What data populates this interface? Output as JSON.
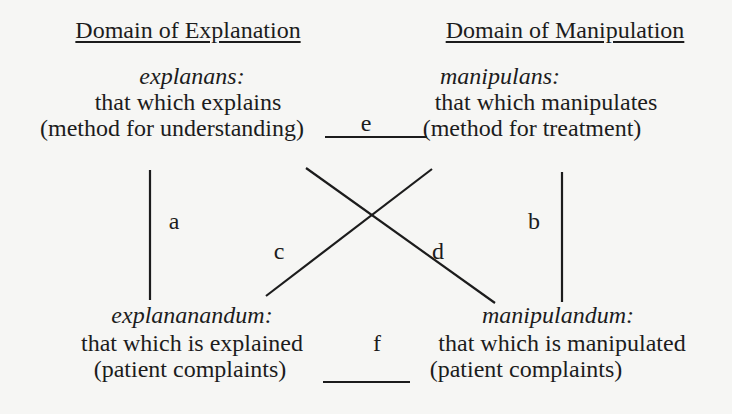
{
  "headers": {
    "left": "Domain of Explanation",
    "right": "Domain of Manipulation"
  },
  "nodes": {
    "top_left": {
      "term": "explanans:",
      "description": "that which explains",
      "detail": "(method for understanding)"
    },
    "top_right": {
      "term": "manipulans:",
      "description": "that which manipulates",
      "detail": "(method for treatment)"
    },
    "bottom_left": {
      "term": "explananandum:",
      "description": "that which is explained",
      "detail": "(patient complaints)"
    },
    "bottom_right": {
      "term": "manipulandum:",
      "description": "that which is manipulated",
      "detail": "(patient complaints)"
    }
  },
  "edges": {
    "a": "a",
    "b": "b",
    "c": "c",
    "d": "d",
    "e": "e",
    "f": "f"
  },
  "colors": {
    "background": "#f6f6f4",
    "ink": "#1c1c1c"
  }
}
